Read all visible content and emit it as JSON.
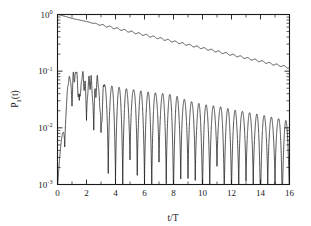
{
  "chart_data": {
    "type": "line",
    "title": "",
    "xlabel": "t/T",
    "ylabel": "P₁(t)",
    "ylabel_base": "P",
    "ylabel_sub": "1",
    "ylabel_tail": "(t)",
    "xlim": [
      0,
      16
    ],
    "ylim": [
      0.001,
      1.0
    ],
    "yscale": "log",
    "xscale": "linear",
    "grid": false,
    "legend": null,
    "xticks": [
      0,
      2,
      4,
      6,
      8,
      10,
      12,
      14,
      16
    ],
    "xticklabels": [
      "0",
      "2",
      "4",
      "6",
      "8",
      "10",
      "12",
      "14",
      "16"
    ],
    "xminor_step": 1,
    "yticks": [
      1.0,
      0.1,
      0.01,
      0.001
    ],
    "yticklabels": [
      "10⁰",
      "10⁻¹",
      "10⁻²",
      "10⁻³"
    ],
    "ytick_mantissa": "10",
    "ytick_exponents": [
      "0",
      "-1",
      "-2",
      "-3"
    ],
    "series": [
      {
        "name": "upper-decay-curve",
        "description": "slowly decaying envelope with small periodic ripples",
        "x": [
          0.0,
          0.25,
          0.5,
          0.75,
          1.0,
          1.25,
          1.5,
          1.75,
          2.0,
          2.25,
          2.5,
          2.75,
          3.0,
          3.25,
          3.5,
          3.75,
          4.0,
          4.25,
          4.5,
          4.75,
          5.0,
          5.25,
          5.5,
          5.75,
          6.0,
          6.25,
          6.5,
          6.75,
          7.0,
          7.25,
          7.5,
          7.75,
          8.0,
          8.25,
          8.5,
          8.75,
          9.0,
          9.25,
          9.5,
          9.75,
          10.0,
          10.25,
          10.5,
          10.75,
          11.0,
          11.25,
          11.5,
          11.75,
          12.0,
          12.25,
          12.5,
          12.75,
          13.0,
          13.25,
          13.5,
          13.75,
          14.0,
          14.25,
          14.5,
          14.75,
          15.0,
          15.25,
          15.5,
          15.75,
          16.0
        ],
        "y": [
          1.0,
          0.97,
          0.93,
          0.89,
          0.855,
          0.825,
          0.8,
          0.775,
          0.75,
          0.725,
          0.7,
          0.675,
          0.655,
          0.632,
          0.612,
          0.592,
          0.572,
          0.553,
          0.535,
          0.517,
          0.5,
          0.483,
          0.467,
          0.452,
          0.437,
          0.423,
          0.409,
          0.395,
          0.382,
          0.369,
          0.357,
          0.345,
          0.334,
          0.323,
          0.312,
          0.302,
          0.292,
          0.282,
          0.273,
          0.264,
          0.255,
          0.247,
          0.239,
          0.231,
          0.223,
          0.216,
          0.209,
          0.202,
          0.195,
          0.189,
          0.183,
          0.177,
          0.171,
          0.165,
          0.16,
          0.155,
          0.15,
          0.145,
          0.14,
          0.135,
          0.131,
          0.127,
          0.123,
          0.119,
          0.115
        ],
        "ripple_amplitude": 0.035,
        "ripple_period": 0.5,
        "ripple_onset": 2.0
      },
      {
        "name": "lower-oscillating-curve",
        "description": "rises to ~0.1 near t/T=1, then oscillates with deep minima approaching 1e-3",
        "envelope_peak_x": [
          0.0,
          0.4,
          0.8,
          1.0,
          1.5,
          2.0,
          2.5,
          3.0,
          3.5,
          4.0,
          4.5,
          5.0,
          5.5,
          6.0,
          6.5,
          7.0,
          7.5,
          8.0,
          8.5,
          9.0,
          9.5,
          10.0,
          10.5,
          11.0,
          11.5,
          12.0,
          12.5,
          13.0,
          13.5,
          14.0,
          14.5,
          15.0,
          15.5,
          16.0
        ],
        "envelope_peak_y": [
          0.0015,
          0.012,
          0.085,
          0.1,
          0.082,
          0.072,
          0.068,
          0.06,
          0.056,
          0.054,
          0.05,
          0.048,
          0.046,
          0.044,
          0.042,
          0.041,
          0.04,
          0.038,
          0.034,
          0.03,
          0.028,
          0.026,
          0.025,
          0.024,
          0.023,
          0.021,
          0.02,
          0.019,
          0.018,
          0.017,
          0.016,
          0.015,
          0.014,
          0.013
        ],
        "envelope_min_x": [
          0.0,
          1.0,
          2.0,
          3.0,
          3.5,
          4.0,
          4.5,
          5.0,
          6.0,
          7.0,
          8.0,
          9.0,
          10.0,
          11.0,
          12.0,
          13.0,
          14.0,
          15.0,
          16.0
        ],
        "envelope_min_y": [
          0.0012,
          0.03,
          0.022,
          0.008,
          0.0022,
          0.006,
          0.0018,
          0.0035,
          0.003,
          0.0022,
          0.0024,
          0.002,
          0.0022,
          0.0018,
          0.002,
          0.0016,
          0.0018,
          0.0012,
          0.0011
        ],
        "oscillation_period": 0.5,
        "peak_count": 32
      }
    ],
    "annotations": []
  },
  "figure": {
    "background_color": "#ffffff",
    "line_color": "#1a1a1a",
    "frame_color": "#1a1a1a"
  }
}
